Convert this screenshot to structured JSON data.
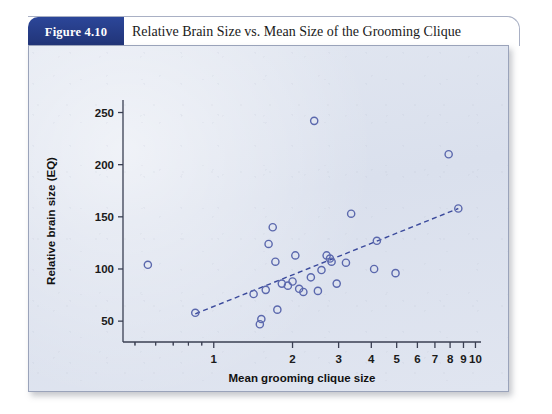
{
  "figure": {
    "badge_label": "Figure 4.10",
    "caption": "Relative Brain Size vs. Mean Size of the Grooming Clique"
  },
  "colors": {
    "badge_background": "#243a87",
    "panel_background": "#dde3ef",
    "marker_stroke": "#5b68ad",
    "trendline": "#3b4a9c",
    "axis": "#3a3f52"
  },
  "chart_data": {
    "type": "scatter",
    "title": "Relative Brain Size vs. Mean Size of the Grooming Clique",
    "xlabel": "Mean grooming clique size",
    "ylabel": "Relative brain size (EQ)",
    "xscale": "log",
    "yscale": "linear",
    "xlim": [
      0.45,
      10.5
    ],
    "ylim": [
      30,
      262
    ],
    "grid": false,
    "legend": false,
    "xticks": [
      1,
      2,
      3,
      4,
      5,
      6,
      7,
      8,
      9,
      10
    ],
    "xtick_labels": [
      "1",
      "2",
      "3",
      "4",
      "5",
      "6",
      "7",
      "8",
      "9",
      "10"
    ],
    "yticks": [
      50,
      100,
      150,
      200,
      250
    ],
    "ytick_labels": [
      "50",
      "100",
      "150",
      "200",
      "250"
    ],
    "series": [
      {
        "name": "Primate species",
        "marker": "open-circle",
        "points": [
          [
            0.56,
            104
          ],
          [
            0.85,
            58
          ],
          [
            1.42,
            76
          ],
          [
            1.5,
            47
          ],
          [
            1.52,
            52
          ],
          [
            1.58,
            80
          ],
          [
            1.62,
            124
          ],
          [
            1.68,
            140
          ],
          [
            1.72,
            107
          ],
          [
            1.75,
            61
          ],
          [
            1.82,
            86
          ],
          [
            1.92,
            84
          ],
          [
            2.0,
            88
          ],
          [
            2.05,
            113
          ],
          [
            2.12,
            81
          ],
          [
            2.2,
            78
          ],
          [
            2.35,
            92
          ],
          [
            2.42,
            242
          ],
          [
            2.5,
            79
          ],
          [
            2.58,
            99
          ],
          [
            2.7,
            113
          ],
          [
            2.78,
            110
          ],
          [
            2.82,
            107
          ],
          [
            2.95,
            86
          ],
          [
            3.2,
            106
          ],
          [
            3.35,
            153
          ],
          [
            4.1,
            100
          ],
          [
            4.2,
            127
          ],
          [
            4.95,
            96
          ],
          [
            7.9,
            210
          ],
          [
            8.6,
            158
          ]
        ]
      }
    ],
    "trendline": {
      "style": "dashed",
      "x_start": 0.85,
      "y_start": 57,
      "x_end": 8.6,
      "y_end": 158
    }
  }
}
